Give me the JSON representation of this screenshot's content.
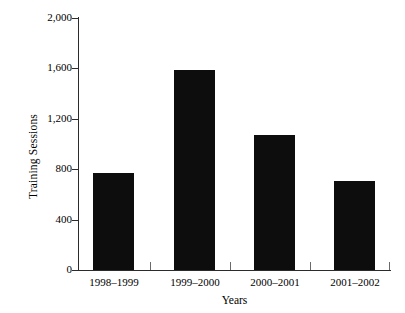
{
  "chart_data": {
    "type": "bar",
    "title": "",
    "subtitle": "",
    "xlabel": "Years",
    "ylabel": "Training Sessions",
    "categories": [
      "1998–1999",
      "1999–2000",
      "2000–2001",
      "2001–2002"
    ],
    "values": [
      770,
      1590,
      1070,
      710
    ],
    "series": [
      {
        "name": "Training Sessions",
        "values": [
          770,
          1590,
          1070,
          710
        ]
      }
    ],
    "ylim": [
      0,
      2000
    ],
    "yticks": [
      0,
      400,
      800,
      1200,
      1600,
      2000
    ],
    "ytick_labels": [
      "0",
      "400",
      "800",
      "1,200",
      "1,600",
      "2,000"
    ],
    "grid": false,
    "legend": false,
    "legend_position": "none",
    "bar_color": "#0d0d0d",
    "axis_color": "#2b2b2b",
    "background_color": "#ffffff",
    "annotations": []
  }
}
